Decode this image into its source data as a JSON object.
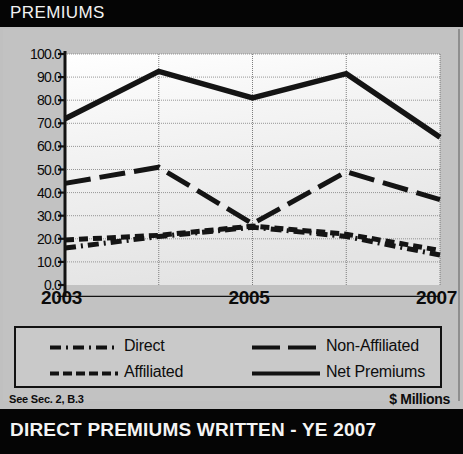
{
  "header": {
    "title": "PREMIUMS"
  },
  "footer": {
    "note": "See Sec. 2, B.3",
    "units": "$ Millions",
    "bottom_bar_title": "DIRECT PREMIUMS WRITTEN - YE 2007"
  },
  "legend": {
    "items": [
      {
        "label": "Direct",
        "style": "dash-dot"
      },
      {
        "label": "Non-Affiliated",
        "style": "long-dash"
      },
      {
        "label": "Affiliated",
        "style": "dashed"
      },
      {
        "label": "Net Premiums",
        "style": "solid"
      }
    ]
  },
  "colors": {
    "ink": "#121212",
    "panel": "#c2c2c2",
    "plot_background": "#f2f2f2",
    "title_bar": "#050505",
    "title_text": "#f2f2f2"
  },
  "chart_data": {
    "type": "line",
    "title": "PREMIUMS",
    "subtitle": "DIRECT PREMIUMS WRITTEN - YE 2007",
    "xlabel": "",
    "ylabel": "",
    "units": "$ Millions",
    "x": [
      2003,
      2004,
      2005,
      2006,
      2007
    ],
    "tick_labels_x": [
      "2003",
      "",
      "2005",
      "",
      "2007"
    ],
    "categories": [
      "2003",
      "2004",
      "2005",
      "2006",
      "2007"
    ],
    "ylim": [
      0.0,
      100.0
    ],
    "yticks": [
      0.0,
      10.0,
      20.0,
      30.0,
      40.0,
      50.0,
      60.0,
      70.0,
      80.0,
      90.0,
      100.0
    ],
    "ytick_labels": [
      "0.0",
      "10.0",
      "20.0",
      "30.0",
      "40.0",
      "50.0",
      "60.0",
      "70.0",
      "80.0",
      "90.0",
      "100.0"
    ],
    "grid": true,
    "legend_position": "bottom",
    "series": [
      {
        "name": "Net Premiums",
        "style": "solid",
        "values": [
          72.0,
          92.5,
          81.0,
          91.5,
          64.0
        ]
      },
      {
        "name": "Non-Affiliated",
        "style": "long-dash",
        "values": [
          44.0,
          51.0,
          26.5,
          49.0,
          37.0
        ]
      },
      {
        "name": "Affiliated",
        "style": "dashed",
        "values": [
          19.5,
          21.5,
          25.5,
          22.0,
          15.0
        ]
      },
      {
        "name": "Direct",
        "style": "dash-dot",
        "values": [
          16.0,
          21.0,
          25.0,
          21.0,
          13.0
        ]
      }
    ]
  }
}
